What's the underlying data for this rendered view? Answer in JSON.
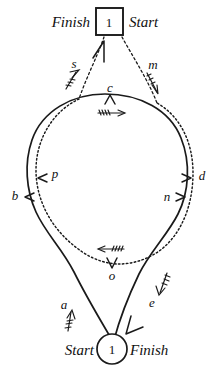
{
  "figure": {
    "background_color": "#ffffff",
    "ink_color": "#1a1a1a"
  },
  "nodes": [
    {
      "id": "node-top",
      "shape": "square",
      "number": "1",
      "left_label": "Finish",
      "right_label": "Start",
      "x": 109,
      "y": 21
    },
    {
      "id": "node-bottom",
      "shape": "circle",
      "number": "1",
      "left_label": "Start",
      "right_label": "Finish",
      "x": 112,
      "y": 349
    }
  ],
  "paths": [
    {
      "id": "solid-loop",
      "style": "solid",
      "description": "outer solid loop from bottom node up around and back"
    },
    {
      "id": "dotted-loop",
      "style": "dotted",
      "description": "inner dotted loop from top square node around and back"
    }
  ],
  "markers": [
    {
      "label": "s",
      "x": 74,
      "y": 64,
      "direction": "up-right",
      "on": "dotted-loop",
      "tail": "feathered"
    },
    {
      "label": "m",
      "x": 153,
      "y": 63,
      "direction": "down-right",
      "on": "dotted-loop",
      "tail": "feathered"
    },
    {
      "label": "c",
      "x": 110,
      "y": 90,
      "direction": "up",
      "on": "solid-loop",
      "tail": "feathered"
    },
    {
      "label": "p",
      "x": 55,
      "y": 177,
      "direction": "left",
      "on": "dotted-loop",
      "tail": "plain"
    },
    {
      "label": "b",
      "x": 15,
      "y": 196,
      "direction": "left",
      "on": "solid-loop",
      "tail": "plain"
    },
    {
      "label": "d",
      "x": 203,
      "y": 177,
      "direction": "right",
      "on": "solid-loop",
      "tail": "plain"
    },
    {
      "label": "n",
      "x": 168,
      "y": 196,
      "direction": "right",
      "on": "dotted-loop",
      "tail": "plain"
    },
    {
      "label": "o",
      "x": 112,
      "y": 272,
      "direction": "down",
      "on": "dotted-loop",
      "tail": "feathered"
    },
    {
      "label": "a",
      "x": 66,
      "y": 306,
      "direction": "up",
      "on": "solid-loop",
      "tail": "feathered"
    },
    {
      "label": "e",
      "x": 152,
      "y": 303,
      "direction": "down-left",
      "on": "solid-loop",
      "tail": "feathered"
    }
  ],
  "labels": {
    "top_left": "Finish",
    "top_right": "Start",
    "bottom_left": "Start",
    "bottom_right": "Finish",
    "s": "s",
    "m": "m",
    "c": "c",
    "p": "p",
    "b": "b",
    "d": "d",
    "n": "n",
    "o": "o",
    "a": "a",
    "e": "e",
    "top_number": "1",
    "bottom_number": "1"
  }
}
